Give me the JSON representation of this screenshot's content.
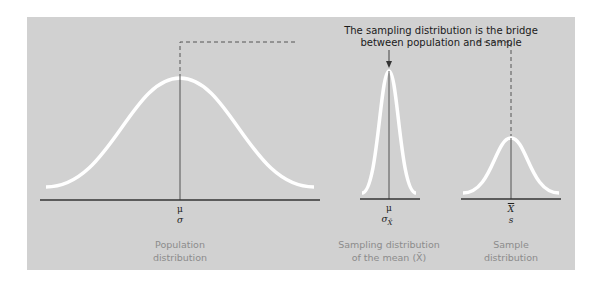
{
  "title": {
    "line1": "The sampling distribution is the bridge",
    "line2": "between population and sample"
  },
  "distributions": [
    {
      "name": "population",
      "symbols": [
        "μ",
        "σ"
      ],
      "caption_line1": "Population",
      "caption_line2": "distribution"
    },
    {
      "name": "sampling",
      "symbols": [
        "μ",
        "σ",
        "X̄"
      ],
      "caption_line1": "Sampling distribution",
      "caption_line2": "of the mean (X̄)"
    },
    {
      "name": "sample",
      "symbols": [
        "X",
        "s"
      ],
      "caption_line1": "Sample",
      "caption_line2": "distribution"
    }
  ],
  "colors": {
    "panel": "#d1d1d1",
    "curve": "#ffffff",
    "axis": "#333333",
    "dash": "#555555",
    "caption": "#8c8c8c"
  }
}
